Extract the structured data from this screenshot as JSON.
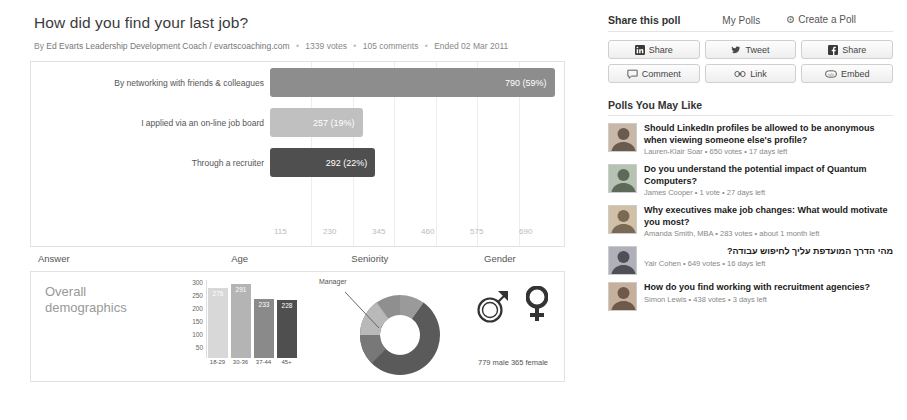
{
  "poll": {
    "title": "How did you find your last job?",
    "byline_prefix": "By",
    "author": "Ed Evarts Leadership Development Coach / evartscoaching.com",
    "votes": "1339 votes",
    "comments": "105 comments",
    "ended": "Ended 02 Mar 2011"
  },
  "chart_data": {
    "type": "bar",
    "orientation": "horizontal",
    "title": "How did you find your last job?",
    "xlabel": "",
    "ylabel": "",
    "categories": [
      "By networking with friends & colleagues",
      "I applied via an on-line job board",
      "Through a recruiter"
    ],
    "values": [
      790,
      257,
      292
    ],
    "percents": [
      "59%",
      "19%",
      "22%"
    ],
    "data_labels": [
      "790 (59%)",
      "257 (19%)",
      "292 (22%)"
    ],
    "bar_colors": [
      "#8d8d8d",
      "#c0c0c0",
      "#4f4f4f"
    ],
    "xticks": [
      "115",
      "230",
      "345",
      "460",
      "575",
      "690"
    ],
    "xlim": [
      0,
      805
    ],
    "grid": true,
    "legend": "none",
    "total_votes": 1339
  },
  "tabs": [
    {
      "label": "Answer"
    },
    {
      "label": "Age"
    },
    {
      "label": "Seniority"
    },
    {
      "label": "Gender"
    }
  ],
  "demographics": {
    "heading_line1": "Overall",
    "heading_line2": "demographics",
    "age_chart": {
      "type": "bar",
      "title": "Age",
      "categories": [
        "18-29",
        "30-36",
        "37-44",
        "45+"
      ],
      "values": [
        276,
        291,
        233,
        228
      ],
      "yticks": [
        "300",
        "250",
        "200",
        "150",
        "100",
        "50"
      ],
      "ylim": [
        0,
        300
      ],
      "bar_colors": [
        "#d8d8d8",
        "#b4b4b4",
        "#8a8a8a",
        "#4f4f4f"
      ]
    },
    "seniority_chart": {
      "type": "pie",
      "title": "Seniority",
      "annotation": "Manager",
      "labels": [
        "Senior",
        "Manager",
        "Entry",
        "Other"
      ],
      "values": [
        40,
        20,
        10,
        30
      ],
      "colors": [
        "#5a5a5a",
        "#8f8f8f",
        "#c8c8c8",
        "#6e6e6e"
      ]
    },
    "gender": {
      "male_icon": "male-symbol-icon",
      "female_icon": "female-symbol-icon",
      "note": "779 male 365 female",
      "male_count": 779,
      "female_count": 365
    }
  },
  "sidebar": {
    "share_title": "Share this poll",
    "my_polls": "My Polls",
    "create_poll": "Create a Poll",
    "create_poll_icon": "gear-icon",
    "share_buttons": [
      {
        "label": "Share",
        "icon": "linkedin-icon"
      },
      {
        "label": "Tweet",
        "icon": "twitter-bird-icon"
      },
      {
        "label": "Share",
        "icon": "facebook-icon"
      },
      {
        "label": "Comment",
        "icon": "speech-bubble-icon"
      },
      {
        "label": "Link",
        "icon": "chain-link-icon"
      },
      {
        "label": "Embed",
        "icon": "embed-code-icon"
      }
    ],
    "polls_title": "Polls You May Like",
    "polls": [
      {
        "question": "Should LinkedIn profiles be allowed to be anonymous when viewing someone else's profile?",
        "author": "Lauren-Klair Soar",
        "votes": "650 votes",
        "time_left": "17 days left",
        "rtl": false
      },
      {
        "question": "Do you understand the potential impact of Quantum Computers?",
        "author": "James Cooper",
        "votes": "1 vote",
        "time_left": "27 days left",
        "rtl": false
      },
      {
        "question": "Why executives make job changes: What would motivate you most?",
        "author": "Amanda Smith, MBA",
        "votes": "283 votes",
        "time_left": "about 1 month left",
        "rtl": false
      },
      {
        "question": "מהי הדרך המועדפת עליך לחיפוש עבודה?",
        "author": "Yair Cohen",
        "votes": "649 votes",
        "time_left": "16 days left",
        "rtl": true
      },
      {
        "question": "How do you find working with recruitment agencies?",
        "author": "Simon Lewis",
        "votes": "438 votes",
        "time_left": "3 days left",
        "rtl": false
      }
    ]
  }
}
